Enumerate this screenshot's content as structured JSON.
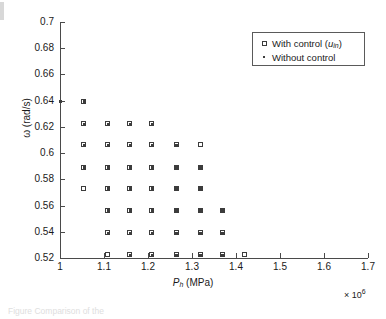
{
  "figure": {
    "caption_fragment": "Figure  Comparison of the",
    "background": "#ffffff",
    "marker_color": "#3c3c3c",
    "axis_color": "#4a4a4a"
  },
  "legend": {
    "position": "top-right",
    "entries": [
      {
        "marker": "open-square",
        "label_prefix": "With control (",
        "label_var": "u",
        "label_sub": "in",
        "label_suffix": ")",
        "label": "With control (u_in)"
      },
      {
        "marker": "dot",
        "label": "Without control"
      }
    ]
  },
  "axes": {
    "x": {
      "title_var": "P",
      "title_sub": "h",
      "title_unit": " (MPa)",
      "title": "P_h (MPa)",
      "exponent_text": "× 10",
      "exponent_power": "6",
      "ticks": [
        "1",
        "1.1",
        "1.2",
        "1.3",
        "1.4",
        "1.5",
        "1.6",
        "1.7"
      ],
      "min": 1.0,
      "max": 1.7,
      "step": 0.1
    },
    "y": {
      "title_var": "ω",
      "title_unit": " (rad/s)",
      "title": "ω (rad/s)",
      "ticks": [
        "0.7",
        "0.68",
        "0.66",
        "0.64",
        "0.62",
        "0.6",
        "0.58",
        "0.56",
        "0.54",
        "0.52"
      ],
      "min": 0.52,
      "max": 0.7,
      "step": 0.02
    }
  },
  "chart_data": {
    "type": "scatter",
    "title": "",
    "xlabel": "P_h (MPa)",
    "ylabel": "ω (rad/s)",
    "xlim": [
      1.0,
      1.7
    ],
    "ylim": [
      0.52,
      0.7
    ],
    "xtick_step": 0.1,
    "ytick_step": 0.02,
    "x_multiplier": "×10^6",
    "grid": false,
    "legend_position": "upper right",
    "series": [
      {
        "name": "With control (u_in)",
        "marker": "open-square",
        "points": [
          [
            1.055,
            0.639
          ],
          [
            1.055,
            0.622
          ],
          [
            1.11,
            0.622
          ],
          [
            1.16,
            0.622
          ],
          [
            1.21,
            0.622
          ],
          [
            1.055,
            0.606
          ],
          [
            1.11,
            0.606
          ],
          [
            1.16,
            0.606
          ],
          [
            1.21,
            0.606
          ],
          [
            1.265,
            0.606
          ],
          [
            1.32,
            0.606
          ],
          [
            1.055,
            0.589
          ],
          [
            1.11,
            0.589
          ],
          [
            1.16,
            0.589
          ],
          [
            1.21,
            0.589
          ],
          [
            1.265,
            0.589
          ],
          [
            1.32,
            0.589
          ],
          [
            1.055,
            0.573
          ],
          [
            1.11,
            0.573
          ],
          [
            1.16,
            0.573
          ],
          [
            1.21,
            0.573
          ],
          [
            1.265,
            0.573
          ],
          [
            1.32,
            0.573
          ],
          [
            1.11,
            0.556
          ],
          [
            1.16,
            0.556
          ],
          [
            1.21,
            0.556
          ],
          [
            1.265,
            0.556
          ],
          [
            1.32,
            0.556
          ],
          [
            1.37,
            0.556
          ],
          [
            1.11,
            0.539
          ],
          [
            1.16,
            0.539
          ],
          [
            1.21,
            0.539
          ],
          [
            1.265,
            0.539
          ],
          [
            1.32,
            0.539
          ],
          [
            1.37,
            0.539
          ],
          [
            1.11,
            0.522
          ],
          [
            1.16,
            0.522
          ],
          [
            1.21,
            0.522
          ],
          [
            1.265,
            0.522
          ],
          [
            1.32,
            0.522
          ],
          [
            1.37,
            0.522
          ],
          [
            1.42,
            0.522
          ]
        ]
      },
      {
        "name": "Without control",
        "marker": "dot",
        "points": [
          [
            1.0,
            0.639
          ],
          [
            1.055,
            0.639
          ],
          [
            1.055,
            0.622
          ],
          [
            1.11,
            0.622
          ],
          [
            1.16,
            0.622
          ],
          [
            1.21,
            0.622
          ],
          [
            1.055,
            0.606
          ],
          [
            1.11,
            0.606
          ],
          [
            1.16,
            0.606
          ],
          [
            1.21,
            0.606
          ],
          [
            1.265,
            0.606
          ],
          [
            1.055,
            0.589
          ],
          [
            1.11,
            0.589
          ],
          [
            1.16,
            0.589
          ],
          [
            1.21,
            0.589
          ],
          [
            1.265,
            0.589
          ],
          [
            1.32,
            0.589
          ],
          [
            1.11,
            0.573
          ],
          [
            1.16,
            0.573
          ],
          [
            1.21,
            0.573
          ],
          [
            1.265,
            0.573
          ],
          [
            1.32,
            0.573
          ],
          [
            1.11,
            0.556
          ],
          [
            1.16,
            0.556
          ],
          [
            1.21,
            0.556
          ],
          [
            1.265,
            0.556
          ],
          [
            1.32,
            0.556
          ],
          [
            1.37,
            0.556
          ],
          [
            1.11,
            0.539
          ],
          [
            1.16,
            0.539
          ],
          [
            1.21,
            0.539
          ],
          [
            1.265,
            0.539
          ],
          [
            1.32,
            0.539
          ],
          [
            1.37,
            0.539
          ],
          [
            1.16,
            0.522
          ],
          [
            1.21,
            0.522
          ],
          [
            1.265,
            0.522
          ],
          [
            1.32,
            0.522
          ],
          [
            1.37,
            0.522
          ]
        ]
      }
    ]
  }
}
